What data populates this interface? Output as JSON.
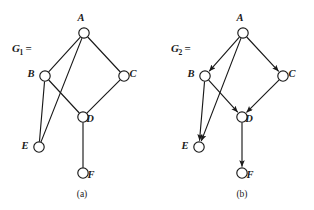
{
  "figure": {
    "background_color": "#ffffff",
    "ink_color": "#1a1a1a",
    "width": 314,
    "height": 210
  },
  "panels": [
    {
      "id": "panel-a",
      "caption": "(a)",
      "caption_pos": {
        "x": 82,
        "y": 197
      },
      "label": {
        "name": "G",
        "subscript": "1",
        "equals": "=",
        "x": 12,
        "y": 52
      },
      "directed": false,
      "nodes": [
        {
          "id": "A",
          "label": "A",
          "x": 84,
          "y": 33,
          "r": 5.2,
          "label_x": 81,
          "label_y": 21
        },
        {
          "id": "B",
          "label": "B",
          "x": 45,
          "y": 76,
          "r": 5.2,
          "label_x": 31,
          "label_y": 77
        },
        {
          "id": "C",
          "label": "C",
          "x": 124,
          "y": 76,
          "r": 5.2,
          "label_x": 133,
          "label_y": 77
        },
        {
          "id": "D",
          "label": "D",
          "x": 83,
          "y": 117,
          "r": 5.2,
          "label_x": 90,
          "label_y": 122
        },
        {
          "id": "E",
          "label": "E",
          "x": 39,
          "y": 147,
          "r": 5.2,
          "label_x": 25,
          "label_y": 149
        },
        {
          "id": "F",
          "label": "F",
          "x": 83,
          "y": 173,
          "r": 5.2,
          "label_x": 91,
          "label_y": 178
        }
      ],
      "edges": [
        {
          "from": "A",
          "to": "B"
        },
        {
          "from": "A",
          "to": "C"
        },
        {
          "from": "A",
          "to": "E"
        },
        {
          "from": "B",
          "to": "E"
        },
        {
          "from": "B",
          "to": "D"
        },
        {
          "from": "C",
          "to": "D"
        },
        {
          "from": "D",
          "to": "F"
        }
      ]
    },
    {
      "id": "panel-b",
      "caption": "(b)",
      "caption_pos": {
        "x": 242,
        "y": 197
      },
      "label": {
        "name": "G",
        "subscript": "2",
        "equals": "=",
        "x": 171,
        "y": 52
      },
      "directed": true,
      "nodes": [
        {
          "id": "A",
          "label": "A",
          "x": 243,
          "y": 33,
          "r": 5.2,
          "label_x": 240,
          "label_y": 21
        },
        {
          "id": "B",
          "label": "B",
          "x": 205,
          "y": 76,
          "r": 5.2,
          "label_x": 191,
          "label_y": 77
        },
        {
          "id": "C",
          "label": "C",
          "x": 283,
          "y": 76,
          "r": 5.2,
          "label_x": 292,
          "label_y": 77
        },
        {
          "id": "D",
          "label": "D",
          "x": 242,
          "y": 117,
          "r": 5.2,
          "label_x": 249,
          "label_y": 122
        },
        {
          "id": "E",
          "label": "E",
          "x": 199,
          "y": 147,
          "r": 5.2,
          "label_x": 185,
          "label_y": 149
        },
        {
          "id": "F",
          "label": "F",
          "x": 242,
          "y": 173,
          "r": 5.2,
          "label_x": 250,
          "label_y": 178
        }
      ],
      "edges": [
        {
          "from": "A",
          "to": "B"
        },
        {
          "from": "A",
          "to": "C"
        },
        {
          "from": "A",
          "to": "E"
        },
        {
          "from": "B",
          "to": "E"
        },
        {
          "from": "B",
          "to": "D"
        },
        {
          "from": "C",
          "to": "D"
        },
        {
          "from": "D",
          "to": "F"
        }
      ]
    }
  ]
}
